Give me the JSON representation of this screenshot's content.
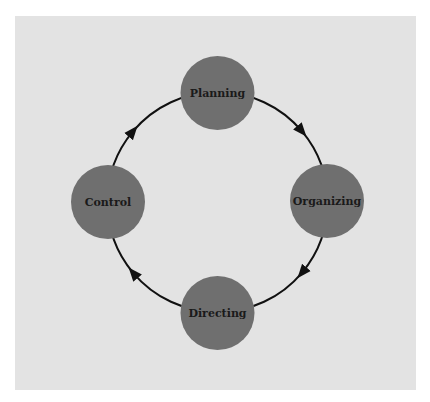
{
  "diagram": {
    "type": "cycle",
    "direction": "clockwise",
    "colors": {
      "page_background": "#ffffff",
      "panel_background": "#e3e3e3",
      "node_fill": "#6f6f6f",
      "ring_stroke": "#111111",
      "label_color": "#1a1a1a"
    },
    "nodes": [
      {
        "id": "planning",
        "label": "Planning",
        "position": "top"
      },
      {
        "id": "organizing",
        "label": "Organizing",
        "position": "right"
      },
      {
        "id": "directing",
        "label": "Directing",
        "position": "bottom"
      },
      {
        "id": "control",
        "label": "Control",
        "position": "left"
      }
    ],
    "edges": [
      {
        "from": "planning",
        "to": "organizing"
      },
      {
        "from": "organizing",
        "to": "directing"
      },
      {
        "from": "directing",
        "to": "control"
      },
      {
        "from": "control",
        "to": "planning"
      }
    ]
  }
}
